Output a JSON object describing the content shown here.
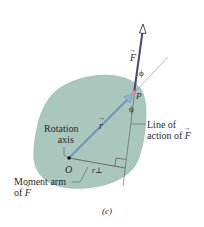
{
  "figure": {
    "caption": "(c)",
    "top_partial_caption": "(b)",
    "colors": {
      "body_fill": "#a9c7bd",
      "body_edge": "#8fb2a6",
      "r_vector": "#6f97c2",
      "force_vector": "#4a4a78",
      "point_P": "#d98a9a",
      "lines": "#555555"
    },
    "labels": {
      "force": "F",
      "position": "r",
      "phi_top": "ϕ",
      "phi_bottom": "ϕ",
      "point_p": "P",
      "origin": "O",
      "moment_arm_symbol": "r⊥",
      "rotation_axis_line1": "Rotation",
      "rotation_axis_line2": "axis",
      "line_of_action_line1": "Line of",
      "line_of_action_line2": "action of",
      "line_of_action_F": "F",
      "moment_arm_line1": "Moment arm",
      "moment_arm_line2": "of",
      "moment_arm_F": "F"
    }
  }
}
